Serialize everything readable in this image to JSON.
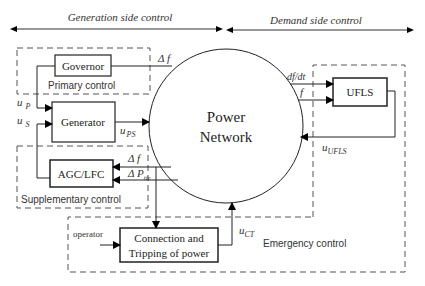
{
  "header": {
    "generation_label": "Generation side control",
    "demand_label": "Demand side control"
  },
  "regions": {
    "primary": "Primary control",
    "supplementary": "Supplementary control",
    "emergency": "Emergency control"
  },
  "blocks": {
    "governor": "Governor",
    "generator": "Generator",
    "agc": "AGC/LFC",
    "network_line1": "Power",
    "network_line2": "Network",
    "ufls": "UFLS",
    "connection_line1": "Connection and",
    "connection_line2": "Tripping of power"
  },
  "signals": {
    "delta_f_primary": "Δ f",
    "u_p": "u",
    "u_p_sub": "P",
    "u_s": "u",
    "u_s_sub": "S",
    "u_ps": "u",
    "u_ps_sub": "PS",
    "delta_f_supp": "Δ f",
    "delta_p": "Δ P",
    "delta_p_sub": "tie",
    "dfdt": "df/dt",
    "f": "f",
    "u_ufls": "u",
    "u_ufls_sub": "UFLS",
    "operator": "operator",
    "u_ct": "u",
    "u_ct_sub": "CT"
  }
}
